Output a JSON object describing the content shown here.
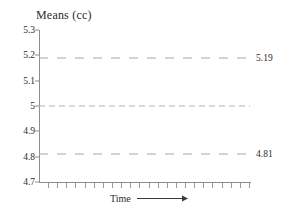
{
  "chart_data": {
    "type": "line",
    "title": "Means (cc)",
    "xlabel": "Time",
    "ylabel": "",
    "ylim": [
      4.7,
      5.3
    ],
    "grid": false,
    "legend": null,
    "y_ticks": [
      "5.3",
      "5.2",
      "5.1",
      "5",
      "4.9",
      "4.8",
      "4.7"
    ],
    "y_tick_values": [
      5.3,
      5.2,
      5.1,
      5.0,
      4.9,
      4.8,
      4.7
    ],
    "x_tick_count": 23,
    "x_tick_labels": [],
    "series": [
      {
        "name": "upper-control-limit",
        "kind": "horizontal-reference-line",
        "value": 5.19,
        "label": "5.19",
        "style": "dashed",
        "color": "#a8a8a8"
      },
      {
        "name": "center-line",
        "kind": "horizontal-reference-line",
        "value": 5.0,
        "label": "",
        "style": "fine-dashed",
        "color": "#b4b4b4"
      },
      {
        "name": "lower-control-limit",
        "kind": "horizontal-reference-line",
        "value": 4.81,
        "label": "4.81",
        "style": "dashed",
        "color": "#a8a8a8"
      }
    ],
    "annotations": [
      {
        "text": "5.19",
        "at_y": 5.19,
        "position": "right"
      },
      {
        "text": "4.81",
        "at_y": 4.81,
        "position": "right"
      }
    ],
    "axis_color": "#8d8d8d",
    "text_color": "#2b2b2b",
    "background": "#ffffff"
  },
  "axis": {
    "x_caption": "Time",
    "arrow_icon": "right-arrow-icon"
  }
}
